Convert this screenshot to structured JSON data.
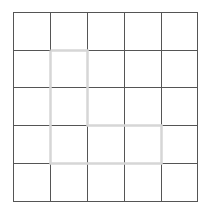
{
  "grid": {
    "rows": 5,
    "cols": 5,
    "x_lines": [
      13,
      50,
      87,
      124,
      161,
      197
    ],
    "y_lines": [
      12,
      50,
      87,
      125,
      163,
      201
    ],
    "line_color": "#555555",
    "line_width": 1
  },
  "highlight_path": {
    "color": "#d6d6d6",
    "width": 2.5,
    "cells": [
      [
        1,
        1
      ],
      [
        2,
        1
      ],
      [
        3,
        1
      ],
      [
        3,
        2
      ],
      [
        3,
        3
      ]
    ],
    "outline": [
      [
        50,
        50
      ],
      [
        87,
        50
      ],
      [
        87,
        125
      ],
      [
        161,
        125
      ],
      [
        161,
        163
      ],
      [
        50,
        163
      ],
      [
        50,
        50
      ]
    ]
  }
}
